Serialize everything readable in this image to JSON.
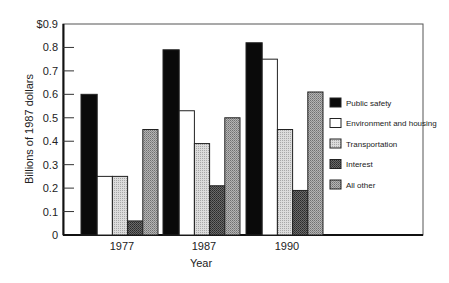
{
  "chart_data": {
    "type": "bar",
    "title": "",
    "xlabel": "Year",
    "ylabel": "Billions of 1987 dollars",
    "ylim": [
      0,
      0.9
    ],
    "yticks": [
      0,
      0.1,
      0.2,
      0.3,
      0.4,
      0.5,
      0.6,
      0.7,
      0.8,
      0.9
    ],
    "ytick_labels": [
      "0",
      "0.1",
      "0.2",
      "0.3",
      "0.4",
      "0.5",
      "0.6",
      "0.7",
      "0.8",
      "$0.9"
    ],
    "grid": false,
    "legend_position": "right",
    "categories": [
      "1977",
      "1987",
      "1990"
    ],
    "series": [
      {
        "name": "Public safety",
        "values": [
          0.6,
          0.79,
          0.82
        ],
        "fill": "#0a0a0a",
        "pattern": "solid"
      },
      {
        "name": "Environment and housing",
        "values": [
          0.25,
          0.53,
          0.75
        ],
        "fill": "#ffffff",
        "pattern": "solid"
      },
      {
        "name": "Transportation",
        "values": [
          0.25,
          0.39,
          0.45
        ],
        "fill": "#c8c8c8",
        "pattern": "dots-light"
      },
      {
        "name": "Interest",
        "values": [
          0.06,
          0.21,
          0.19
        ],
        "fill": "#555555",
        "pattern": "dots-dark"
      },
      {
        "name": "All other",
        "values": [
          0.45,
          0.5,
          0.61
        ],
        "fill": "#9a9a9a",
        "pattern": "dots-medium"
      }
    ]
  }
}
